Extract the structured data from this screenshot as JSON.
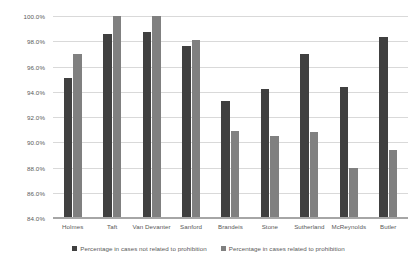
{
  "chart_data": {
    "type": "bar",
    "title": "",
    "xlabel": "",
    "ylabel": "",
    "ylim": [
      84.0,
      100.0
    ],
    "ytick_step": 2.0,
    "ytick_labels": [
      "100.0%",
      "98.0%",
      "96.0%",
      "94.0%",
      "92.0%",
      "90.0%",
      "88.0%",
      "86.0%",
      "84.0%"
    ],
    "ytick_values": [
      100.0,
      98.0,
      96.0,
      94.0,
      92.0,
      90.0,
      88.0,
      86.0,
      84.0
    ],
    "grid": true,
    "grid_axis": "y",
    "legend_position": "bottom",
    "orientation": "vertical",
    "grouping": "clustered",
    "categories": [
      "Holmes",
      "Taft",
      "Van Devanter",
      "Sanford",
      "Brandeis",
      "Stone",
      "Sutherland",
      "McReynolds",
      "Butler"
    ],
    "series": [
      {
        "name": "Percentage in cases not related to prohibition",
        "color": "#404040",
        "values": [
          95.1,
          98.6,
          98.7,
          97.6,
          93.3,
          94.2,
          97.0,
          94.4,
          98.3
        ]
      },
      {
        "name": "Percentage in cases related to prohibition",
        "color": "#808080",
        "values": [
          97.0,
          100.0,
          100.0,
          98.1,
          90.9,
          90.5,
          90.8,
          88.0,
          89.4
        ]
      }
    ]
  },
  "axes": {
    "y_labels": [
      "100.0%",
      "98.0%",
      "96.0%",
      "94.0%",
      "92.0%",
      "90.0%",
      "88.0%",
      "86.0%",
      "84.0%"
    ],
    "x_labels": [
      "Holmes",
      "Taft",
      "Van Devanter",
      "Sanford",
      "Brandeis",
      "Stone",
      "Sutherland",
      "McReynolds",
      "Butler"
    ]
  },
  "legend": {
    "items": [
      {
        "label": "Percentage in cases not related to prohibition",
        "color": "#404040"
      },
      {
        "label": "Percentage in cases related to prohibition",
        "color": "#808080"
      }
    ]
  },
  "colors": {
    "series_1": "#404040",
    "series_2": "#808080",
    "gridline": "#d9d9d9",
    "axis": "#a6a6a6",
    "text": "#595959",
    "background": "#ffffff"
  }
}
